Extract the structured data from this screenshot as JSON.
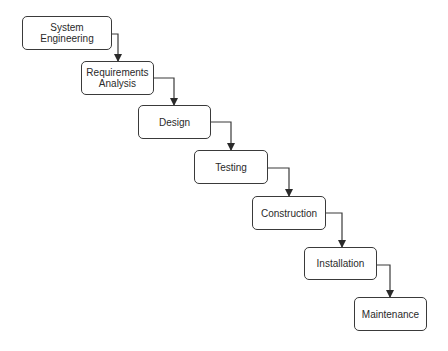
{
  "diagram": {
    "type": "waterfall",
    "stages": [
      {
        "id": "system-engineering",
        "lines": [
          "System",
          "Engineering"
        ]
      },
      {
        "id": "requirements-analysis",
        "lines": [
          "Requirements",
          "Analysis"
        ]
      },
      {
        "id": "design",
        "lines": [
          "Design"
        ]
      },
      {
        "id": "testing",
        "lines": [
          "Testing"
        ]
      },
      {
        "id": "construction",
        "lines": [
          "Construction"
        ]
      },
      {
        "id": "installation",
        "lines": [
          "Installation"
        ]
      },
      {
        "id": "maintenance",
        "lines": [
          "Maintenance"
        ]
      }
    ],
    "edges": [
      {
        "from": "system-engineering",
        "to": "requirements-analysis"
      },
      {
        "from": "requirements-analysis",
        "to": "design"
      },
      {
        "from": "design",
        "to": "testing"
      },
      {
        "from": "testing",
        "to": "construction"
      },
      {
        "from": "construction",
        "to": "installation"
      },
      {
        "from": "installation",
        "to": "maintenance"
      }
    ],
    "colors": {
      "stroke": "#3a3a3a",
      "text": "#2a2a2a",
      "background": "#ffffff"
    }
  }
}
